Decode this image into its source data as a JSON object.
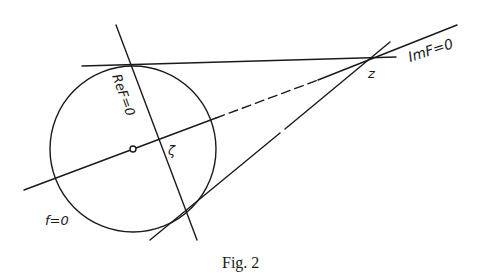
{
  "figure": {
    "caption": "Fig. 2",
    "labels": {
      "re_f": "ReF=0",
      "im_f": "ImF=0",
      "f_zero": "f=0",
      "z": "z",
      "zeta": "ζ"
    }
  }
}
